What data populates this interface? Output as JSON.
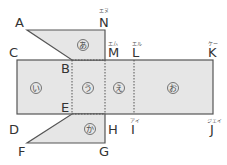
{
  "diagram": {
    "type": "net-of-solid",
    "colors": {
      "fill": "#e6e6e6",
      "stroke": "#555555",
      "text": "#333333"
    },
    "points": {
      "A": "A",
      "B": "B",
      "C": "C",
      "D": "D",
      "E": "E",
      "F": "F",
      "G": "G",
      "H": "H",
      "I": "I",
      "J": "J",
      "K": "K",
      "L": "L",
      "M": "M",
      "N": "N"
    },
    "readings": {
      "N": "エヌ",
      "M": "エム",
      "L": "エル",
      "K": "ケー",
      "I": "アイ",
      "J": "ジェイ"
    },
    "faces": {
      "a": "あ",
      "i": "い",
      "u": "う",
      "e": "え",
      "o": "お",
      "ka": "か"
    }
  }
}
